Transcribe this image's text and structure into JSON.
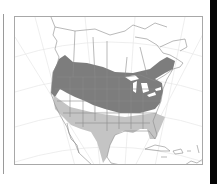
{
  "map": {
    "title": "",
    "region": "North America",
    "projection_graticule": true,
    "legend": [
      {
        "label": "Breeding / year-round range",
        "color": "#7d7d7d"
      },
      {
        "label": "Winter range",
        "color": "#c4c4c4"
      }
    ],
    "colors": {
      "background": "#ffffff",
      "land_outline": "#8a8a8a",
      "graticule": "#e8e8e8",
      "frame": "#a8a8a8",
      "range_dark": "#7d7d7d",
      "range_light": "#c4c4c4",
      "water_lakes": "#ffffff"
    }
  }
}
